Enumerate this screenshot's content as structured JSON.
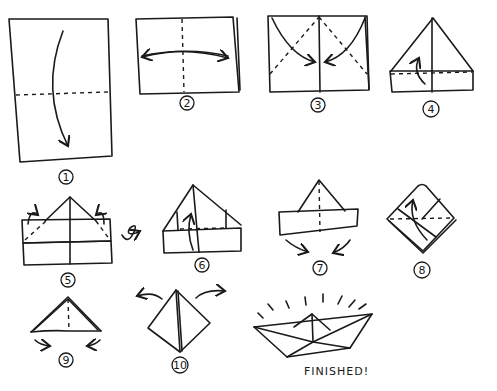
{
  "diagram": {
    "steps": [
      {
        "number": "1",
        "label": "1"
      },
      {
        "number": "2",
        "label": "2"
      },
      {
        "number": "3",
        "label": "3"
      },
      {
        "number": "4",
        "label": "4"
      },
      {
        "number": "5",
        "label": "5"
      },
      {
        "number": "6",
        "label": "6"
      },
      {
        "number": "7",
        "label": "7"
      },
      {
        "number": "8",
        "label": "8"
      },
      {
        "number": "9",
        "label": "9"
      },
      {
        "number": "10",
        "label": "10"
      }
    ],
    "finished_label": "FINISHED!"
  }
}
